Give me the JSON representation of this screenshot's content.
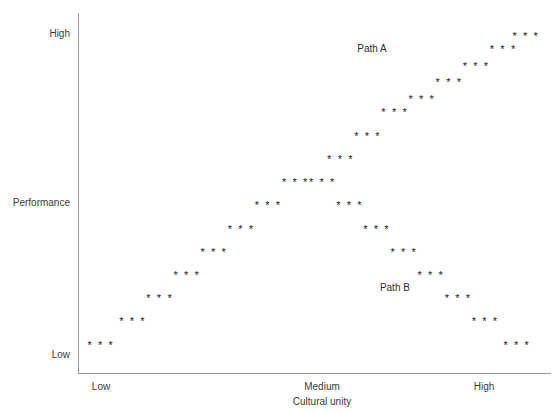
{
  "chart_data": {
    "type": "scatter",
    "title": "",
    "xlabel": "Cultural unity",
    "ylabel": "Performance",
    "xtick_labels": [
      "Low",
      "Medium",
      "High"
    ],
    "ytick_labels": [
      "High",
      "Low"
    ],
    "grid": false,
    "legend_position": "inline-annotations",
    "marker_glyph": "* * *",
    "marker_color": "#1a1a1a",
    "axis_color": "#9a9a9a",
    "xlim": [
      0,
      100
    ],
    "ylim": [
      0,
      100
    ],
    "annotations": [
      {
        "name": "path-a",
        "text": "Path A",
        "x": 64,
        "y": 93
      },
      {
        "name": "path-b",
        "text": "Path B",
        "x": 69,
        "y": 21
      }
    ],
    "series": [
      {
        "name": "Path A",
        "description": "Performance rises steadily as cultural unity increases",
        "points": [
          {
            "x": 3,
            "y": 4
          },
          {
            "x": 10,
            "y": 11
          },
          {
            "x": 16,
            "y": 18
          },
          {
            "x": 22,
            "y": 25
          },
          {
            "x": 28,
            "y": 32
          },
          {
            "x": 34,
            "y": 39
          },
          {
            "x": 40,
            "y": 46
          },
          {
            "x": 46,
            "y": 53
          },
          {
            "x": 52,
            "y": 53
          },
          {
            "x": 56,
            "y": 60
          },
          {
            "x": 62,
            "y": 67
          },
          {
            "x": 68,
            "y": 74
          },
          {
            "x": 74,
            "y": 78
          },
          {
            "x": 80,
            "y": 83
          },
          {
            "x": 86,
            "y": 88
          },
          {
            "x": 92,
            "y": 93
          },
          {
            "x": 97,
            "y": 97
          }
        ]
      },
      {
        "name": "Path B",
        "description": "Performance falls after the medium point as cultural unity increases",
        "points": [
          {
            "x": 58,
            "y": 46
          },
          {
            "x": 64,
            "y": 39
          },
          {
            "x": 70,
            "y": 32
          },
          {
            "x": 76,
            "y": 25
          },
          {
            "x": 82,
            "y": 18
          },
          {
            "x": 88,
            "y": 11
          },
          {
            "x": 95,
            "y": 4
          }
        ]
      }
    ]
  },
  "axis": {
    "y_high": "High",
    "y_low": "Low",
    "y_title": "Performance",
    "x_low": "Low",
    "x_medium": "Medium",
    "x_high": "High",
    "x_title": "Cultural unity"
  },
  "annotations": {
    "path_a": "Path A",
    "path_b": "Path B"
  },
  "title": ""
}
